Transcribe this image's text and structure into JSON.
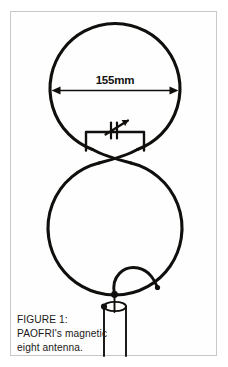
{
  "figure": {
    "frame": {
      "border_color": "#c9c9c9",
      "background": "#fefefe"
    },
    "stroke_color": "#100f0d",
    "dimension": {
      "label": "155mm",
      "name": "diameter-dimension"
    },
    "caption": {
      "line1": "FIGURE 1:",
      "line2": "PAOFRI's magnetic",
      "line3": "eight antenna."
    },
    "components": {
      "upper_loop": "upper-loop",
      "lower_loop": "lower-loop",
      "capacitor_box": "capacitor-enclosure",
      "variable_capacitor": "variable-capacitor-symbol",
      "coupling_loop": "coupling-loop",
      "coax_feed": "coax-feedline"
    }
  }
}
